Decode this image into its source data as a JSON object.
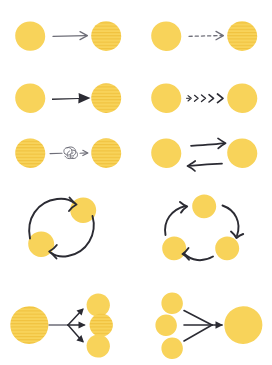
{
  "figure": {
    "background_color": "#FFFFFF",
    "node_color": "#F8D35A",
    "arrow_dark_color": "#2B2B33",
    "arrow_gray_color": "#6E6E78",
    "grid": {
      "columns": 2,
      "rows": 5,
      "total_panels": 10
    },
    "width": 272,
    "height": 365
  },
  "panels": [
    {
      "id": "panel-1",
      "position": "row-1-col-1",
      "name": "simple-solid-arrow",
      "label": "Thin solid arrow, single direction",
      "arrow_style": "solid-thin",
      "arrow_color": "#6E6E78",
      "direction": "left-to-right",
      "node_count": 2,
      "nodes": [
        {
          "name": "source-node",
          "fill": "plain",
          "cx": 30,
          "cy": 36,
          "r": 15
        },
        {
          "name": "target-node",
          "fill": "hatched",
          "cx": 106,
          "cy": 36,
          "r": 15
        }
      ]
    },
    {
      "id": "panel-2",
      "position": "row-1-col-2",
      "name": "dashed-arrow",
      "label": "Dashed arrow, single direction",
      "arrow_style": "dashed",
      "arrow_color": "#6E6E78",
      "direction": "left-to-right",
      "node_count": 2,
      "nodes": [
        {
          "name": "source-node",
          "fill": "plain",
          "cx": 166,
          "cy": 36,
          "r": 15
        },
        {
          "name": "target-node",
          "fill": "hatched",
          "cx": 242,
          "cy": 36,
          "r": 15
        }
      ]
    },
    {
      "id": "panel-3",
      "position": "row-2-col-1",
      "name": "bold-thick-arrow",
      "label": "Thick bold black arrow, single direction",
      "arrow_style": "solid-thick",
      "arrow_color": "#2B2B33",
      "direction": "left-to-right",
      "node_count": 2,
      "nodes": [
        {
          "name": "source-node",
          "fill": "plain",
          "cx": 30,
          "cy": 98,
          "r": 15
        },
        {
          "name": "target-node",
          "fill": "hatched",
          "cx": 106,
          "cy": 98,
          "r": 15
        }
      ]
    },
    {
      "id": "panel-4",
      "position": "row-2-col-2",
      "name": "chevron-sequence-arrow",
      "label": "Series of small chevrons of increasing size",
      "arrow_style": "chevron-series",
      "arrow_color": "#2B2B33",
      "direction": "left-to-right",
      "chevron_count": 5,
      "node_count": 2,
      "nodes": [
        {
          "name": "source-node",
          "fill": "plain",
          "cx": 166,
          "cy": 98,
          "r": 15
        },
        {
          "name": "target-node",
          "fill": "plain",
          "cx": 242,
          "cy": 98,
          "r": 15
        }
      ]
    },
    {
      "id": "panel-5",
      "position": "row-3-col-1",
      "name": "knotted-arrow",
      "label": "Thin arrow with tangled knot in the middle",
      "arrow_style": "solid-thin-with-knot",
      "arrow_color": "#6E6E78",
      "direction": "left-to-right",
      "node_count": 2,
      "nodes": [
        {
          "name": "source-node",
          "fill": "hatched",
          "cx": 30,
          "cy": 153,
          "r": 15
        },
        {
          "name": "target-node",
          "fill": "hatched",
          "cx": 106,
          "cy": 153,
          "r": 15
        }
      ]
    },
    {
      "id": "panel-6",
      "position": "row-3-col-2",
      "name": "bidirectional-arrows",
      "label": "Two opposing arrows, forward on top and backward below",
      "arrow_style": "bidirectional-pair",
      "arrow_color": "#2B2B33",
      "direction": "bidirectional",
      "node_count": 2,
      "nodes": [
        {
          "name": "left-node",
          "fill": "plain",
          "cx": 166,
          "cy": 153,
          "r": 15
        },
        {
          "name": "right-node",
          "fill": "plain",
          "cx": 242,
          "cy": 153,
          "r": 15
        }
      ]
    },
    {
      "id": "panel-7",
      "position": "row-4-col-1",
      "name": "two-node-cycle",
      "label": "Circular cycle between two nodes with curved arrows",
      "arrow_style": "curved-cycle",
      "arrow_color": "#2B2B33",
      "direction": "clockwise-cycle",
      "node_count": 2,
      "nodes": [
        {
          "name": "cycle-node-top-right",
          "fill": "plain",
          "cx": 83,
          "cy": 210,
          "r": 13
        },
        {
          "name": "cycle-node-bottom-left",
          "fill": "plain",
          "cx": 41,
          "cy": 244,
          "r": 13
        }
      ]
    },
    {
      "id": "panel-8",
      "position": "row-4-col-2",
      "name": "three-node-cycle",
      "label": "Triangular cycle between three nodes with curved arrows",
      "arrow_style": "curved-cycle",
      "arrow_color": "#2B2B33",
      "direction": "clockwise-cycle",
      "node_count": 3,
      "nodes": [
        {
          "name": "cycle-node-top",
          "fill": "plain",
          "cx": 204,
          "cy": 206,
          "r": 12
        },
        {
          "name": "cycle-node-bottom-right",
          "fill": "plain",
          "cx": 227,
          "cy": 248,
          "r": 12
        },
        {
          "name": "cycle-node-bottom-left",
          "fill": "plain",
          "cx": 174,
          "cy": 248,
          "r": 12
        }
      ]
    },
    {
      "id": "panel-9",
      "position": "row-5-col-1",
      "name": "one-to-many-fan-out",
      "label": "One large node branching into three smaller nodes",
      "arrow_style": "fan-out",
      "arrow_color": "#2B2B33",
      "direction": "one-to-many",
      "branch_count": 3,
      "node_count": 4,
      "nodes": [
        {
          "name": "source-node",
          "fill": "hatched",
          "cx": 29,
          "cy": 325,
          "r": 19
        },
        {
          "name": "target-node-top",
          "fill": "plain",
          "cx": 98,
          "cy": 305,
          "r": 12
        },
        {
          "name": "target-node-middle",
          "fill": "hatched",
          "cx": 101,
          "cy": 325,
          "r": 12
        },
        {
          "name": "target-node-bottom",
          "fill": "plain",
          "cx": 98,
          "cy": 346,
          "r": 12
        }
      ]
    },
    {
      "id": "panel-10",
      "position": "row-5-col-2",
      "name": "many-to-one-fan-in",
      "label": "Three smaller nodes converging into one large node",
      "arrow_style": "fan-in",
      "arrow_color": "#2B2B33",
      "direction": "many-to-one",
      "branch_count": 3,
      "node_count": 4,
      "nodes": [
        {
          "name": "source-node-top",
          "fill": "plain",
          "cx": 172,
          "cy": 303,
          "r": 11
        },
        {
          "name": "source-node-middle",
          "fill": "plain",
          "cx": 166,
          "cy": 325,
          "r": 11
        },
        {
          "name": "source-node-bottom",
          "fill": "plain",
          "cx": 172,
          "cy": 348,
          "r": 11
        },
        {
          "name": "target-node",
          "fill": "plain",
          "cx": 243,
          "cy": 325,
          "r": 19
        }
      ]
    }
  ]
}
